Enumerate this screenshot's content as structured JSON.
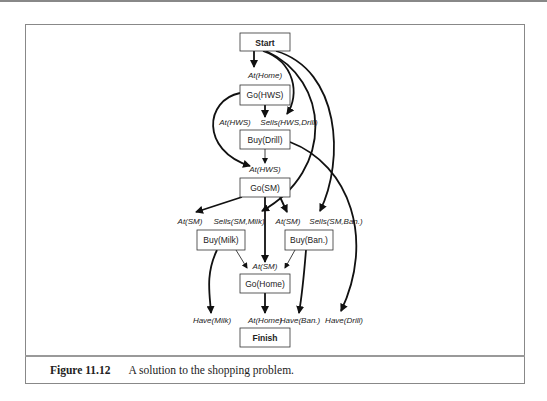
{
  "figure": {
    "number": "Figure 11.12",
    "caption": "A solution to the shopping problem."
  },
  "nodes": {
    "start": "Start",
    "go_hws": "Go(HWS)",
    "buy_drill": "Buy(Drill)",
    "go_sm": "Go(SM)",
    "buy_milk": "Buy(Milk)",
    "buy_ban": "Buy(Ban.)",
    "go_home": "Go(Home)",
    "finish": "Finish"
  },
  "conditions": {
    "at_home_1": "At(Home)",
    "at_hws_1": "At(HWS)",
    "sells_hws_drill": "Sells(HWS,Drill)",
    "at_hws_2": "At(HWS)",
    "at_sm_1": "At(SM)",
    "sells_sm_milk": "Sells(SM,Milk)",
    "at_sm_2": "At(SM)",
    "sells_sm_ban": "Sells(SM,Ban.)",
    "at_sm_3": "At(SM)",
    "have_milk": "Have(Milk)",
    "at_home_2": "At(Home)",
    "have_ban": "Have(Ban.)",
    "have_drill": "Have(Drill)"
  },
  "colors": {
    "line": "#111111",
    "frame": "#888888"
  }
}
